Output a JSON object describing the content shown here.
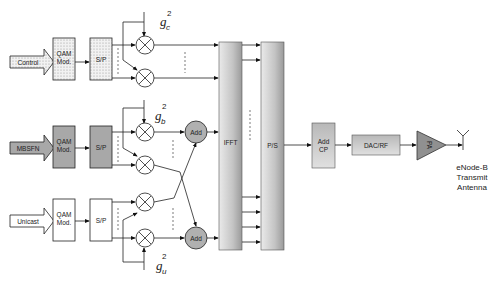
{
  "diagram": {
    "type": "block-diagram",
    "inputs": [
      {
        "label": "Control",
        "mod": "QAM Mod.",
        "sp": "S/P",
        "gain": "g",
        "gain_sub": "c",
        "gain_sup": "2",
        "style": "dotted"
      },
      {
        "label": "MBSFN",
        "mod": "QAM Mod.",
        "sp": "S/P",
        "gain": "g",
        "gain_sub": "b",
        "gain_sup": "2",
        "style": "gray"
      },
      {
        "label": "Unicast",
        "mod": "QAM Mod.",
        "sp": "S/P",
        "gain": "g",
        "gain_sub": "u",
        "gain_sup": "2",
        "style": "white"
      }
    ],
    "adders": [
      {
        "label": "Add"
      },
      {
        "label": "Add"
      }
    ],
    "ifft": {
      "label": "IFFT"
    },
    "ps": {
      "label": "P/S"
    },
    "addcp": {
      "line1": "Add",
      "line2": "CP"
    },
    "dacrf": {
      "label": "DAC/RF"
    },
    "pa": {
      "label": "PA"
    },
    "antenna": {
      "line1": "eNode-B",
      "line2": "Transmit",
      "line3": "Antenna"
    },
    "colors": {
      "gray_block": "#a8a8a8",
      "adder": "#b0b0b0",
      "line": "#222222"
    }
  }
}
